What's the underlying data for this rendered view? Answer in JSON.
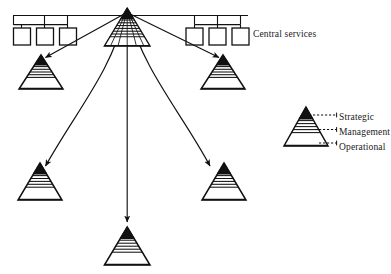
{
  "diagram": {
    "background_color": "#ffffff",
    "stroke_color": "#111111",
    "fill_strategic": "#111111",
    "fill_management": "#ffffff",
    "fill_operational": "#ffffff"
  },
  "central_services": {
    "label": "Central services",
    "box_count": 6,
    "boxes_left": [
      {
        "name": "central-service-box-1"
      },
      {
        "name": "central-service-box-2"
      },
      {
        "name": "central-service-box-3"
      }
    ],
    "boxes_right": [
      {
        "name": "central-service-box-4"
      },
      {
        "name": "central-service-box-5"
      },
      {
        "name": "central-service-box-6"
      }
    ]
  },
  "head_office": {
    "name": "head-office-pyramid",
    "layers": [
      "Strategic",
      "Management",
      "Operational"
    ]
  },
  "business_units": [
    {
      "name": "business-unit-pyramid-top-left",
      "position": "top-left"
    },
    {
      "name": "business-unit-pyramid-top-right",
      "position": "top-right"
    },
    {
      "name": "business-unit-pyramid-mid-left",
      "position": "mid-left"
    },
    {
      "name": "business-unit-pyramid-mid-right",
      "position": "mid-right"
    },
    {
      "name": "business-unit-pyramid-bottom",
      "position": "bottom-centre"
    }
  ],
  "connectors": {
    "count": 5,
    "style": "arrow",
    "description": "arrows from head office apex to each business unit"
  },
  "legend": {
    "strategic": "Strategic",
    "management": "Management",
    "operational": "Operational"
  }
}
